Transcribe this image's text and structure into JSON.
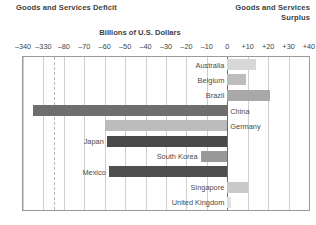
{
  "header": {
    "left_title": "Goods and Services Deficit",
    "right_title_line1": "Goods and Services",
    "right_title_line2": "Surplus"
  },
  "axis_title": "Billions of U.S. Dollars",
  "chart_data": {
    "type": "bar",
    "orientation": "horizontal",
    "title": "Billions of U.S. Dollars",
    "xlabel": "Billions of U.S. Dollars",
    "ylabel": "",
    "grid": true,
    "legend": false,
    "axis_break": {
      "from": -330,
      "to": -80
    },
    "tick_labels": [
      "-340",
      "-330",
      "-80",
      "-70",
      "-60",
      "-50",
      "-40",
      "-30",
      "-20",
      "-10",
      "0",
      "+10",
      "+20",
      "+30",
      "+40"
    ],
    "tick_values": [
      -340,
      -330,
      -80,
      -70,
      -60,
      -50,
      -40,
      -30,
      -20,
      -10,
      0,
      10,
      20,
      30,
      40
    ],
    "xlim": [
      -340,
      40
    ],
    "categories": [
      "Australia",
      "Belgium",
      "Brazil",
      "China",
      "Germany",
      "Japan",
      "South Korea",
      "Mexico",
      "Singapore",
      "United Kingdom"
    ],
    "values": [
      14,
      9,
      21,
      -335,
      -60,
      -59,
      -13,
      -58,
      10,
      2
    ],
    "bar_colors": [
      "#d8d8d8",
      "#bdbdbd",
      "#a8a8a8",
      "#6e6e6e",
      "#bcbcbc",
      "#4a4a4a",
      "#999999",
      "#4f4f4f",
      "#c9c9c9",
      "#e2e2e2"
    ],
    "label_positions": [
      "left",
      "left",
      "left",
      "right",
      "right",
      "left",
      "left",
      "left",
      "left",
      "left"
    ]
  }
}
